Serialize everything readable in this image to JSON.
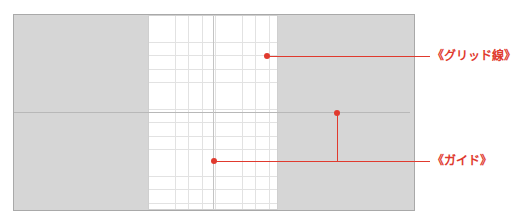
{
  "canvas": {
    "background": "#d6d6d6",
    "page_background": "#ffffff"
  },
  "annotations": {
    "grid_label": "《グリッド線》",
    "guide_label": "《ガイド》",
    "accent_color": "#e03a2e"
  }
}
